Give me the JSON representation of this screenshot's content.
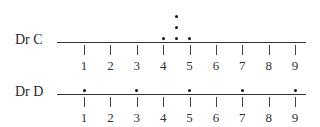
{
  "chart_data": {
    "type": "dot",
    "title": "",
    "xlabel": "",
    "ylabel": "",
    "xlim": [
      1,
      9
    ],
    "x_ticks": [
      "1",
      "2",
      "3",
      "4",
      "5",
      "6",
      "7",
      "8",
      "9"
    ],
    "grid": false,
    "series": [
      {
        "name": "Dr C",
        "values": [
          4,
          4.5,
          4.5,
          4.5,
          5
        ]
      },
      {
        "name": "Dr D",
        "values": [
          1,
          3,
          5,
          7,
          9
        ]
      }
    ]
  },
  "rows": [
    {
      "label": "Dr C"
    },
    {
      "label": "Dr D"
    }
  ]
}
